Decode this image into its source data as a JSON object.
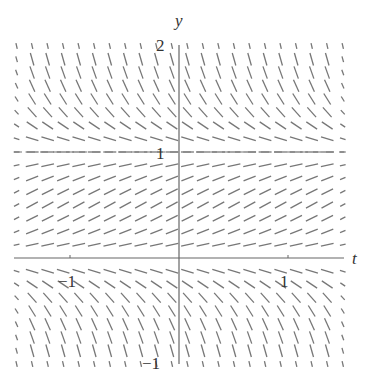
{
  "chart_data": {
    "type": "slope-field",
    "title": "",
    "xlabel": "t",
    "ylabel": "y",
    "xlim": [
      -1.5,
      1.5
    ],
    "ylim": [
      -1,
      2
    ],
    "x_ticks": [
      {
        "value": -1,
        "label": "−1"
      },
      {
        "value": 1,
        "label": "1"
      }
    ],
    "y_ticks": [
      {
        "value": 2,
        "label": "2"
      },
      {
        "value": 1,
        "label": "1"
      },
      {
        "value": -1,
        "label": "−1"
      }
    ],
    "equilibria": [
      {
        "y": 0,
        "style": "solid"
      },
      {
        "y": 1,
        "style": "dashed"
      }
    ],
    "slope_function": "dy/dt = k * y * (1 - y)",
    "k": 2.2,
    "grid": {
      "t_start": -1.49,
      "t_step": 0.1425,
      "t_count": 22,
      "y_start": -1.0,
      "y_step": 0.125,
      "y_count": 25
    },
    "segment_length_px": 13,
    "colors": {
      "field": "#777777",
      "axis": "#666666",
      "label": "#333333"
    }
  },
  "labels": {
    "y_axis": "y",
    "t_axis": "t",
    "y_tick_2": "2",
    "y_tick_1": "1",
    "y_tick_neg1": "−1",
    "t_tick_neg1": "−1",
    "t_tick_1": "1"
  }
}
